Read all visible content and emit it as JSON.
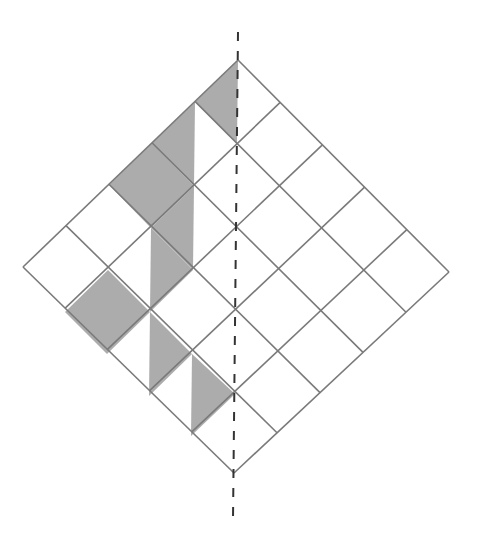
{
  "diagram": {
    "type": "rotated-square-grid",
    "grid_size": 5,
    "vertices": {
      "top": [
        238,
        60
      ],
      "right": [
        449,
        272
      ],
      "bottom": [
        234,
        473
      ],
      "left": [
        23,
        267
      ]
    },
    "colors": {
      "background": "#ffffff",
      "grid_line": "#7a7a7a",
      "shade": "#acacac",
      "dashed_axis": "#333333"
    },
    "dashed_axis": {
      "x1": 238,
      "y1": 32,
      "x2": 233,
      "y2": 520,
      "dash": "9 10"
    },
    "shaded_regions": [
      {
        "id": "cell-0-0-left-triangle",
        "points": [
          [
            238,
            60
          ],
          [
            195,
            102
          ],
          [
            237,
            144
          ]
        ]
      },
      {
        "id": "cell-0-1-left-triangle",
        "points": [
          [
            195,
            102
          ],
          [
            152,
            143
          ],
          [
            194,
            186
          ]
        ]
      },
      {
        "id": "cell-0-2-full",
        "points": [
          [
            152,
            143
          ],
          [
            194,
            186
          ],
          [
            151,
            228
          ],
          [
            109,
            185
          ]
        ]
      },
      {
        "id": "cell-1-2-left-triangle",
        "points": [
          [
            194,
            186
          ],
          [
            151,
            228
          ],
          [
            193,
            270
          ]
        ]
      },
      {
        "id": "cell-1-3-right-triangle",
        "points": [
          [
            151,
            228
          ],
          [
            193,
            270
          ],
          [
            150,
            312
          ]
        ]
      },
      {
        "id": "cell-1-4-full",
        "points": [
          [
            108,
            270
          ],
          [
            150,
            312
          ],
          [
            107,
            354
          ],
          [
            65,
            312
          ]
        ]
      },
      {
        "id": "cell-2-4-right-triangle",
        "points": [
          [
            150,
            312
          ],
          [
            192,
            354
          ],
          [
            149,
            396
          ]
        ]
      },
      {
        "id": "cell-3-4-right-triangle",
        "points": [
          [
            192,
            354
          ],
          [
            235,
            394
          ],
          [
            191,
            436
          ]
        ]
      }
    ]
  }
}
